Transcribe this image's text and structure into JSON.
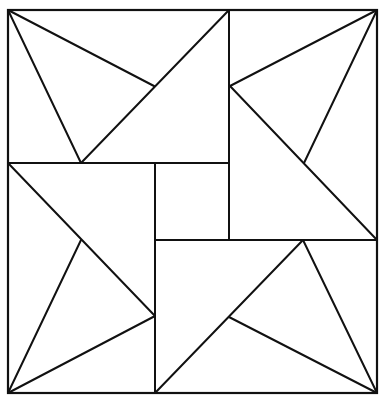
{
  "diagram": {
    "stroke": "#111111",
    "background": "#ffffff",
    "outer": {
      "x1": 8,
      "y1": 10,
      "x2": 377,
      "y2": 393
    },
    "lines": [
      [
        8,
        163,
        229,
        163
      ],
      [
        229,
        10,
        229,
        240
      ],
      [
        155,
        163,
        155,
        393
      ],
      [
        155,
        240,
        377,
        240
      ],
      [
        8,
        10,
        154,
        86
      ],
      [
        8,
        10,
        81,
        163
      ],
      [
        81,
        163,
        229,
        10
      ],
      [
        377,
        10,
        230,
        86
      ],
      [
        377,
        10,
        304,
        163
      ],
      [
        230,
        86,
        377,
        240
      ],
      [
        377,
        393,
        303,
        240
      ],
      [
        377,
        393,
        229,
        317
      ],
      [
        303,
        240,
        155,
        393
      ],
      [
        8,
        393,
        81,
        240
      ],
      [
        8,
        393,
        155,
        316
      ],
      [
        8,
        163,
        155,
        316
      ]
    ]
  }
}
